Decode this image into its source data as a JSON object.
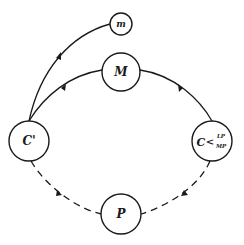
{
  "diagram": {
    "type": "circuit-of-capital",
    "nodes": [
      {
        "id": "m",
        "label": "m",
        "cx": 121,
        "cy": 24,
        "r": 11
      },
      {
        "id": "M",
        "label": "M",
        "cx": 121,
        "cy": 72,
        "r": 19
      },
      {
        "id": "C_prime",
        "label": "C'",
        "cx": 29,
        "cy": 141,
        "r": 20
      },
      {
        "id": "C",
        "label": "C",
        "sup": "LP",
        "sub": "MP",
        "cx": 212,
        "cy": 141,
        "r": 20
      },
      {
        "id": "P",
        "label": "P",
        "cx": 121,
        "cy": 214,
        "r": 20
      }
    ],
    "edges": [
      {
        "from": "C_prime",
        "to": "m",
        "style": "solid",
        "arrow": "mid"
      },
      {
        "from": "C_prime",
        "to": "M",
        "style": "solid",
        "arrow": "mid"
      },
      {
        "from": "M",
        "to": "C",
        "style": "solid",
        "arrow": "mid"
      },
      {
        "from": "C",
        "to": "P",
        "style": "dashed",
        "arrow": "mid"
      },
      {
        "from": "C_prime",
        "to": "P",
        "style": "dashed",
        "arrow": "mid"
      }
    ],
    "colors": {
      "stroke": "#1a1a1a",
      "background": "#ffffff"
    }
  }
}
